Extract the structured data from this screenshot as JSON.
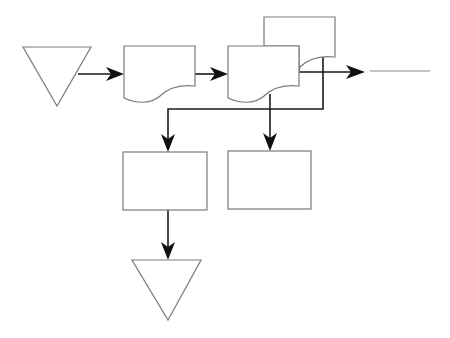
{
  "diagram": {
    "type": "flowchart",
    "background": "#ffffff",
    "colors": {
      "shape_stroke": "#7a7a7a",
      "connector": "#1a1a1a",
      "arrowhead": "#111111"
    },
    "nodes": [
      {
        "id": "merge-top",
        "shape": "inverted-triangle",
        "label": ""
      },
      {
        "id": "document-1",
        "shape": "document",
        "label": ""
      },
      {
        "id": "multi-document",
        "shape": "multi-document",
        "label": ""
      },
      {
        "id": "process-left",
        "shape": "rectangle",
        "label": ""
      },
      {
        "id": "process-right",
        "shape": "rectangle",
        "label": ""
      },
      {
        "id": "merge-bottom",
        "shape": "inverted-triangle",
        "label": ""
      }
    ],
    "edges": [
      {
        "from": "merge-top",
        "to": "document-1"
      },
      {
        "from": "document-1",
        "to": "multi-document"
      },
      {
        "from": "multi-document",
        "to": "off-page-right"
      },
      {
        "from": "multi-document",
        "to": "process-left"
      },
      {
        "from": "multi-document",
        "to": "process-right"
      },
      {
        "from": "process-left",
        "to": "merge-bottom"
      }
    ]
  }
}
